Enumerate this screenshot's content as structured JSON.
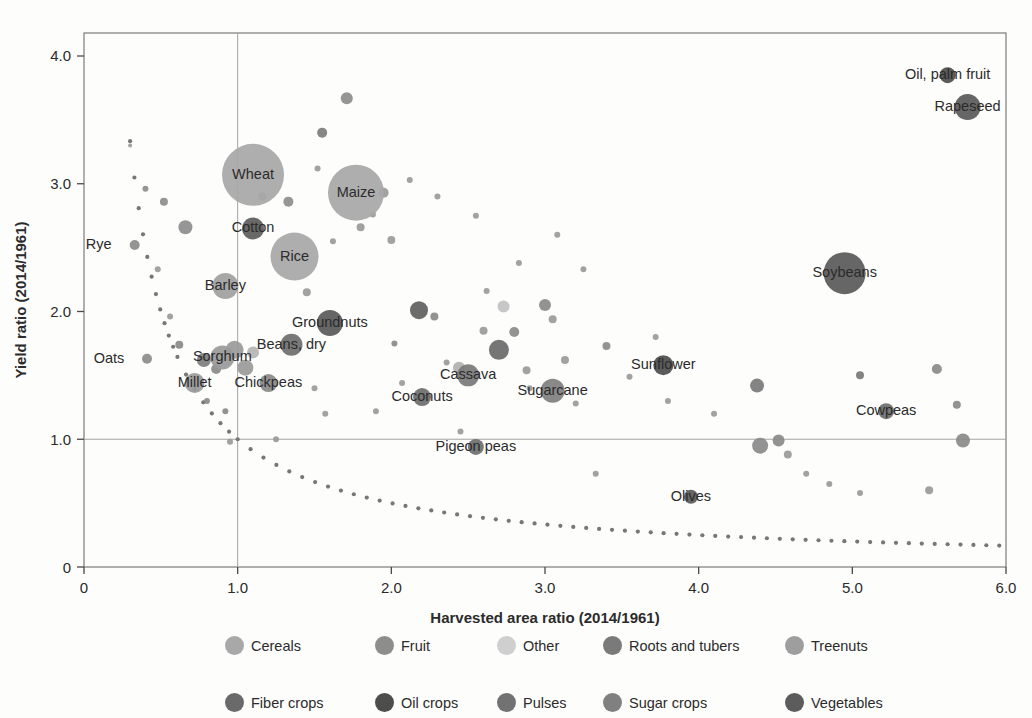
{
  "chart_data": {
    "type": "scatter",
    "title": "",
    "xlabel": "Harvested area ratio (2014/1961)",
    "ylabel": "Yield ratio (2014/1961)",
    "xlim": [
      0,
      6.0
    ],
    "ylim": [
      0,
      4.18
    ],
    "xticks": [
      "0",
      "1.0",
      "2.0",
      "3.0",
      "4.0",
      "5.0",
      "6.0"
    ],
    "xtick_values": [
      0,
      1.0,
      2.0,
      3.0,
      4.0,
      5.0,
      6.0
    ],
    "yticks": [
      "0",
      "1.0",
      "2.0",
      "3.0",
      "4.0"
    ],
    "ytick_values": [
      0,
      1.0,
      2.0,
      3.0,
      4.0
    ],
    "grid": "reference lines at x=1.0 and y=1.0",
    "reference_lines": {
      "vertical_x": 1.0,
      "horizontal_y": 1.0
    },
    "annotation_curve": {
      "name": "constant-production-hyperbola",
      "equation": "x * y = 1",
      "style": "dotted",
      "color": "#777777"
    },
    "legend": {
      "position": "below-plot",
      "entries": [
        {
          "label": "Cereals",
          "color": "#a8a8a8"
        },
        {
          "label": "Fruit",
          "color": "#8d8d8d"
        },
        {
          "label": "Other",
          "color": "#cfcfcf"
        },
        {
          "label": "Roots and tubers",
          "color": "#7a7a7a"
        },
        {
          "label": "Treenuts",
          "color": "#9e9e9e"
        },
        {
          "label": "Fiber crops",
          "color": "#6a6a6a"
        },
        {
          "label": "Oil crops",
          "color": "#4d4d4d"
        },
        {
          "label": "Pulses",
          "color": "#727272"
        },
        {
          "label": "Sugar crops",
          "color": "#808080"
        },
        {
          "label": "Vegetables",
          "color": "#5c5c5c"
        }
      ]
    },
    "labeled_points": [
      {
        "label": "Wheat",
        "x": 1.1,
        "y": 3.07,
        "r": 31,
        "group": "Cereals",
        "color": "#a8a8a8",
        "label_dx": 0,
        "label_dy": 4
      },
      {
        "label": "Maize",
        "x": 1.77,
        "y": 2.93,
        "r": 28,
        "group": "Cereals",
        "color": "#a8a8a8",
        "label_dx": 0,
        "label_dy": 4
      },
      {
        "label": "Rice",
        "x": 1.37,
        "y": 2.43,
        "r": 24,
        "group": "Cereals",
        "color": "#a8a8a8",
        "label_dx": 0,
        "label_dy": 4
      },
      {
        "label": "Cotton",
        "x": 1.1,
        "y": 2.65,
        "r": 11,
        "group": "Fiber crops",
        "color": "#5e5e5e",
        "label_dx": 0,
        "label_dy": 4
      },
      {
        "label": "Barley",
        "x": 0.92,
        "y": 2.2,
        "r": 13,
        "group": "Cereals",
        "color": "#a0a0a0",
        "label_dx": 0,
        "label_dy": 4
      },
      {
        "label": "Rye",
        "x": 0.33,
        "y": 2.52,
        "r": 5,
        "group": "Cereals",
        "color": "#8d8d8d",
        "label_dx": -36,
        "label_dy": 4
      },
      {
        "label": "Oats",
        "x": 0.41,
        "y": 1.63,
        "r": 5,
        "group": "Cereals",
        "color": "#8d8d8d",
        "label_dx": -38,
        "label_dy": 4
      },
      {
        "label": "Millet",
        "x": 0.72,
        "y": 1.44,
        "r": 10,
        "group": "Cereals",
        "color": "#9a9a9a",
        "label_dx": 0,
        "label_dy": 4
      },
      {
        "label": "Sorghum",
        "x": 0.9,
        "y": 1.64,
        "r": 12,
        "group": "Cereals",
        "color": "#9a9a9a",
        "label_dx": 0,
        "label_dy": 4
      },
      {
        "label": "Chickpeas",
        "x": 1.2,
        "y": 1.44,
        "r": 9,
        "group": "Pulses",
        "color": "#8a8a8a",
        "label_dx": 0,
        "label_dy": 4
      },
      {
        "label": "Beans, dry",
        "x": 1.35,
        "y": 1.74,
        "r": 11,
        "group": "Pulses",
        "color": "#6f6f6f",
        "label_dx": 0,
        "label_dy": 4
      },
      {
        "label": "Groundnuts",
        "x": 1.6,
        "y": 1.91,
        "r": 13,
        "group": "Oil crops",
        "color": "#5a5a5a",
        "label_dx": 0,
        "label_dy": 4
      },
      {
        "label": "Cassava",
        "x": 2.5,
        "y": 1.5,
        "r": 11,
        "group": "Roots and tubers",
        "color": "#7a7a7a",
        "label_dx": 0,
        "label_dy": 4
      },
      {
        "label": "Coconuts",
        "x": 2.2,
        "y": 1.33,
        "r": 9,
        "group": "Treenuts",
        "color": "#6e6e6e",
        "label_dx": 0,
        "label_dy": 4
      },
      {
        "label": "Sugarcane",
        "x": 3.05,
        "y": 1.38,
        "r": 12,
        "group": "Sugar crops",
        "color": "#808080",
        "label_dx": 0,
        "label_dy": 4
      },
      {
        "label": "Pigeon peas",
        "x": 2.55,
        "y": 0.94,
        "r": 8,
        "group": "Pulses",
        "color": "#6f6f6f",
        "label_dx": 0,
        "label_dy": 4
      },
      {
        "label": "Sunflower",
        "x": 3.77,
        "y": 1.58,
        "r": 10,
        "group": "Oil crops",
        "color": "#4f4f4f",
        "label_dx": 0,
        "label_dy": 4
      },
      {
        "label": "Olives",
        "x": 3.95,
        "y": 0.55,
        "r": 7,
        "group": "Oil crops",
        "color": "#5a5a5a",
        "label_dx": 0,
        "label_dy": 4
      },
      {
        "label": "Soybeans",
        "x": 4.95,
        "y": 2.3,
        "r": 21,
        "group": "Oil crops",
        "color": "#5a5a5a",
        "label_dx": 0,
        "label_dy": 4
      },
      {
        "label": "Cowpeas",
        "x": 5.22,
        "y": 1.22,
        "r": 8,
        "group": "Pulses",
        "color": "#6f6f6f",
        "label_dx": 0,
        "label_dy": 4
      },
      {
        "label": "Rapeseed",
        "x": 5.75,
        "y": 3.6,
        "r": 13,
        "group": "Oil crops",
        "color": "#5a5a5a",
        "label_dx": 0,
        "label_dy": 4
      },
      {
        "label": "Oil, palm fruit",
        "x": 5.62,
        "y": 3.85,
        "r": 8,
        "group": "Oil crops",
        "color": "#4f4f4f",
        "label_dx": 0,
        "label_dy": 4
      }
    ],
    "unlabeled_points": [
      {
        "x": 0.3,
        "y": 3.3,
        "r": 2,
        "color": "#9a9a9a"
      },
      {
        "x": 0.52,
        "y": 2.86,
        "r": 4,
        "color": "#8d8d8d"
      },
      {
        "x": 0.4,
        "y": 2.96,
        "r": 3,
        "color": "#8d8d8d"
      },
      {
        "x": 0.66,
        "y": 2.66,
        "r": 7,
        "color": "#8d8d8d"
      },
      {
        "x": 0.48,
        "y": 2.33,
        "r": 3,
        "color": "#9a9a9a"
      },
      {
        "x": 0.56,
        "y": 1.96,
        "r": 3,
        "color": "#9a9a9a"
      },
      {
        "x": 0.62,
        "y": 1.74,
        "r": 4,
        "color": "#8a8a8a"
      },
      {
        "x": 0.78,
        "y": 1.62,
        "r": 7,
        "color": "#7d7d7d"
      },
      {
        "x": 0.86,
        "y": 1.55,
        "r": 5,
        "color": "#8a8a8a"
      },
      {
        "x": 0.98,
        "y": 1.7,
        "r": 9,
        "color": "#9a9a9a"
      },
      {
        "x": 1.05,
        "y": 1.56,
        "r": 8,
        "color": "#9a9a9a"
      },
      {
        "x": 1.1,
        "y": 1.68,
        "r": 6,
        "color": "#b4b4b4"
      },
      {
        "x": 0.8,
        "y": 1.3,
        "r": 3,
        "color": "#8a8a8a"
      },
      {
        "x": 0.92,
        "y": 1.22,
        "r": 3,
        "color": "#8a8a8a"
      },
      {
        "x": 1.16,
        "y": 2.9,
        "r": 4,
        "color": "#8d8d8d"
      },
      {
        "x": 1.33,
        "y": 2.86,
        "r": 5,
        "color": "#8d8d8d"
      },
      {
        "x": 1.55,
        "y": 3.4,
        "r": 5,
        "color": "#7d7d7d"
      },
      {
        "x": 1.71,
        "y": 3.67,
        "r": 6,
        "color": "#8d8d8d"
      },
      {
        "x": 1.52,
        "y": 3.12,
        "r": 3,
        "color": "#9a9a9a"
      },
      {
        "x": 1.45,
        "y": 2.15,
        "r": 4,
        "color": "#9a9a9a"
      },
      {
        "x": 1.5,
        "y": 1.4,
        "r": 3,
        "color": "#9a9a9a"
      },
      {
        "x": 1.57,
        "y": 1.2,
        "r": 3,
        "color": "#9a9a9a"
      },
      {
        "x": 1.62,
        "y": 2.55,
        "r": 3,
        "color": "#9a9a9a"
      },
      {
        "x": 1.8,
        "y": 2.66,
        "r": 4,
        "color": "#9a9a9a"
      },
      {
        "x": 1.88,
        "y": 2.76,
        "r": 3,
        "color": "#9a9a9a"
      },
      {
        "x": 1.95,
        "y": 2.93,
        "r": 5,
        "color": "#9a9a9a"
      },
      {
        "x": 2.0,
        "y": 2.56,
        "r": 4,
        "color": "#9a9a9a"
      },
      {
        "x": 2.02,
        "y": 1.75,
        "r": 3,
        "color": "#8a8a8a"
      },
      {
        "x": 2.12,
        "y": 3.03,
        "r": 3,
        "color": "#9a9a9a"
      },
      {
        "x": 2.18,
        "y": 2.01,
        "r": 9,
        "color": "#5f5f5f"
      },
      {
        "x": 2.3,
        "y": 2.9,
        "r": 3,
        "color": "#9a9a9a"
      },
      {
        "x": 2.28,
        "y": 1.96,
        "r": 4,
        "color": "#8a8a8a"
      },
      {
        "x": 2.36,
        "y": 1.6,
        "r": 3,
        "color": "#9a9a9a"
      },
      {
        "x": 2.44,
        "y": 1.56,
        "r": 6,
        "color": "#b0b0b0"
      },
      {
        "x": 2.55,
        "y": 2.75,
        "r": 3,
        "color": "#9a9a9a"
      },
      {
        "x": 2.6,
        "y": 1.85,
        "r": 4,
        "color": "#9a9a9a"
      },
      {
        "x": 2.62,
        "y": 2.16,
        "r": 3,
        "color": "#9a9a9a"
      },
      {
        "x": 2.7,
        "y": 1.7,
        "r": 10,
        "color": "#6a6a6a"
      },
      {
        "x": 2.73,
        "y": 2.04,
        "r": 6,
        "color": "#c2c2c2"
      },
      {
        "x": 2.8,
        "y": 1.84,
        "r": 5,
        "color": "#8a8a8a"
      },
      {
        "x": 2.88,
        "y": 1.54,
        "r": 4,
        "color": "#9a9a9a"
      },
      {
        "x": 2.83,
        "y": 2.38,
        "r": 3,
        "color": "#9a9a9a"
      },
      {
        "x": 2.9,
        "y": 1.4,
        "r": 3,
        "color": "#9a9a9a"
      },
      {
        "x": 3.0,
        "y": 2.05,
        "r": 6,
        "color": "#8a8a8a"
      },
      {
        "x": 3.05,
        "y": 1.94,
        "r": 4,
        "color": "#9a9a9a"
      },
      {
        "x": 3.08,
        "y": 2.6,
        "r": 3,
        "color": "#9a9a9a"
      },
      {
        "x": 3.13,
        "y": 1.62,
        "r": 4,
        "color": "#9a9a9a"
      },
      {
        "x": 3.2,
        "y": 1.28,
        "r": 3,
        "color": "#9a9a9a"
      },
      {
        "x": 3.25,
        "y": 2.33,
        "r": 3,
        "color": "#9a9a9a"
      },
      {
        "x": 3.4,
        "y": 1.73,
        "r": 4,
        "color": "#8a8a8a"
      },
      {
        "x": 3.55,
        "y": 1.49,
        "r": 3,
        "color": "#9a9a9a"
      },
      {
        "x": 3.72,
        "y": 1.8,
        "r": 3,
        "color": "#9a9a9a"
      },
      {
        "x": 3.8,
        "y": 1.3,
        "r": 3,
        "color": "#9a9a9a"
      },
      {
        "x": 4.1,
        "y": 1.2,
        "r": 3,
        "color": "#9a9a9a"
      },
      {
        "x": 4.38,
        "y": 1.42,
        "r": 7,
        "color": "#7a7a7a"
      },
      {
        "x": 4.4,
        "y": 0.95,
        "r": 8,
        "color": "#8a8a8a"
      },
      {
        "x": 4.52,
        "y": 0.99,
        "r": 6,
        "color": "#8a8a8a"
      },
      {
        "x": 4.58,
        "y": 0.88,
        "r": 4,
        "color": "#9a9a9a"
      },
      {
        "x": 4.7,
        "y": 0.73,
        "r": 3,
        "color": "#9a9a9a"
      },
      {
        "x": 4.85,
        "y": 0.65,
        "r": 3,
        "color": "#9a9a9a"
      },
      {
        "x": 5.05,
        "y": 0.58,
        "r": 3,
        "color": "#9a9a9a"
      },
      {
        "x": 5.05,
        "y": 1.5,
        "r": 4,
        "color": "#7a7a7a"
      },
      {
        "x": 5.55,
        "y": 1.55,
        "r": 5,
        "color": "#8a8a8a"
      },
      {
        "x": 5.68,
        "y": 1.27,
        "r": 4,
        "color": "#8a8a8a"
      },
      {
        "x": 5.72,
        "y": 0.99,
        "r": 7,
        "color": "#8a8a8a"
      },
      {
        "x": 5.5,
        "y": 0.6,
        "r": 4,
        "color": "#9a9a9a"
      },
      {
        "x": 1.25,
        "y": 1.0,
        "r": 3,
        "color": "#9a9a9a"
      },
      {
        "x": 1.9,
        "y": 1.22,
        "r": 3,
        "color": "#9a9a9a"
      },
      {
        "x": 2.07,
        "y": 1.44,
        "r": 3,
        "color": "#9a9a9a"
      },
      {
        "x": 2.45,
        "y": 1.06,
        "r": 3,
        "color": "#9a9a9a"
      },
      {
        "x": 3.33,
        "y": 0.73,
        "r": 3,
        "color": "#9a9a9a"
      },
      {
        "x": 0.95,
        "y": 0.98,
        "r": 3,
        "color": "#9a9a9a"
      }
    ]
  }
}
